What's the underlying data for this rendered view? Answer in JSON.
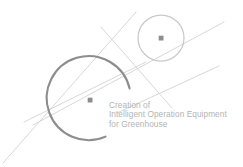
{
  "logo": {
    "name": "creation-of-intelligent-operation-equipment-for-greenhouse-logo",
    "background_color": "#ffffff",
    "colors": {
      "arc_stroke": "#8d8d8d",
      "small_circle_stroke": "#c9c9c9",
      "thin_line_stroke": "#d2d2d2",
      "center_dot": "#8d8d8d",
      "text": "#b4b4b4"
    },
    "tagline": {
      "line1": "Creation of",
      "line2": "Intelligent Operation Equipment",
      "line3": "for Greenhouse"
    },
    "shapes": {
      "large_arc": {
        "cx": 90,
        "cy": 100,
        "r": 42,
        "gap": "right"
      },
      "small_circle": {
        "cx": 161,
        "cy": 38,
        "r": 23
      },
      "large_center_dot": {
        "cx": 90,
        "cy": 100,
        "r": 2.4
      },
      "small_center_dot": {
        "cx": 161,
        "cy": 38,
        "r": 2.4
      }
    }
  }
}
